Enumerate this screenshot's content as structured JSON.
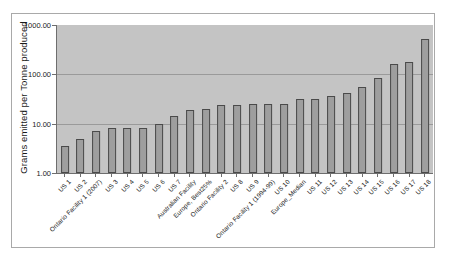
{
  "chart_data": {
    "type": "bar",
    "title": "",
    "xlabel": "",
    "ylabel": "Grams emitted per Tonne produced",
    "yscale": "log",
    "ylim": [
      1.0,
      1000.0
    ],
    "ytick_labels": [
      "1000.00",
      "100.00",
      "10.00",
      "1.00"
    ],
    "ytick_values": [
      1000.0,
      100.0,
      10.0,
      1.0
    ],
    "grid": true,
    "legend": "none",
    "categories": [
      "US 1",
      "US 2",
      "Ontario Facility 1 (2007)",
      "US 3",
      "US 4",
      "US 5",
      "US 6",
      "US 7",
      "Australian  Facility",
      "Europe, Best25%",
      "Ontario Facility 2",
      "US 8",
      "US 9",
      "Ontario Facility 1 (1994-99)",
      "US 10",
      "Europe_Median",
      "US 11",
      "US 12",
      "US 13",
      "US 14",
      "US 15",
      "US 16",
      "US 17",
      "US 18"
    ],
    "values": [
      3.5,
      5.0,
      7.0,
      8.0,
      8.0,
      8.0,
      10.0,
      14.0,
      19.0,
      20.0,
      24.0,
      24.0,
      25.0,
      25.0,
      25.0,
      31.0,
      31.0,
      37.0,
      42.0,
      55.0,
      85.0,
      160.0,
      180.0,
      530.0
    ]
  }
}
